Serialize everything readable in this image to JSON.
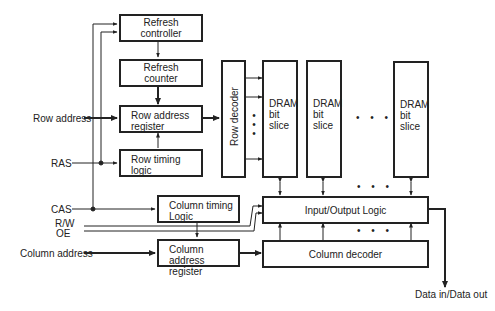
{
  "diagram": {
    "blocks": {
      "refresh_controller": "Refresh controller",
      "refresh_counter": "Refresh counter",
      "row_address_register": "Row address register",
      "row_timing_logic": "Row timing logic",
      "row_decoder": "Row decoder",
      "dram_bit_slice": "DRAM bit slice",
      "column_timing_logic": "Column timing Logic",
      "column_address_register": "Column address register",
      "io_logic": "Input/Output Logic",
      "column_decoder": "Column decoder"
    },
    "block_lines": {
      "refresh_controller": [
        "Refresh",
        "controller"
      ],
      "refresh_counter": [
        "Refresh",
        "counter"
      ],
      "row_address_register": [
        "Row address",
        "register"
      ],
      "row_timing_logic": [
        "Row timing",
        "logic"
      ],
      "column_timing_logic": [
        "Column timing",
        "Logic"
      ],
      "column_address_register": [
        "Column address",
        "register"
      ],
      "dram_bit_slice": [
        "DRAM",
        "bit",
        "slice"
      ]
    },
    "inputs": {
      "row_address": "Row address",
      "ras": "RAS",
      "cas": "CAS",
      "rw": "R/W",
      "oe": "OE",
      "column_address": "Column address"
    },
    "outputs": {
      "data": "Data in/Data out"
    },
    "ellipsis": "• • •",
    "bit_slice_count_shown": 3
  }
}
